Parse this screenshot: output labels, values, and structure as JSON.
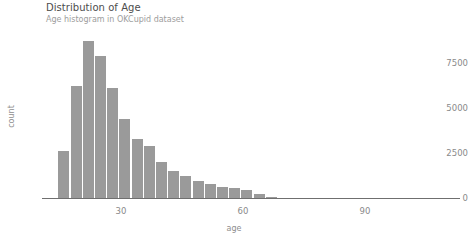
{
  "chart_data": {
    "type": "bar",
    "title": "Distribution of Age",
    "subtitle": "Age histogram in OKCupid dataset",
    "xlabel": "age",
    "ylabel": "count",
    "xlim": [
      14,
      112
    ],
    "ylim": [
      0,
      9000
    ],
    "grid": false,
    "legend": "none",
    "bar_color": "#9a9a9a",
    "x_ticks": [
      {
        "value": 30,
        "label": "30"
      },
      {
        "value": 60,
        "label": "60"
      },
      {
        "value": 90,
        "label": "90"
      }
    ],
    "y_ticks": [
      {
        "value": 0,
        "label": "0"
      },
      {
        "value": 2500,
        "label": "2500"
      },
      {
        "value": 5000,
        "label": "5000"
      },
      {
        "value": 7500,
        "label": "7500"
      }
    ],
    "categories": [
      16,
      19,
      22,
      25,
      28,
      31,
      34,
      37,
      40,
      43,
      46,
      49,
      52,
      55,
      58,
      61,
      64,
      67
    ],
    "values": [
      2600,
      6200,
      8700,
      7900,
      6100,
      4400,
      3300,
      2900,
      2000,
      1500,
      1250,
      950,
      800,
      620,
      560,
      470,
      200,
      60
    ],
    "bin_width": 3
  },
  "canvas": {
    "width": 468,
    "height": 245,
    "background": "#ffffff"
  }
}
